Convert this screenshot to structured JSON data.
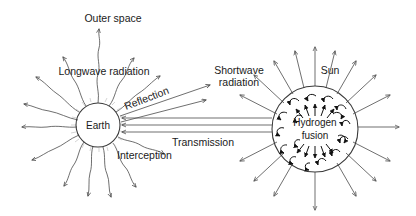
{
  "diagram": {
    "background_color": "#ffffff",
    "line_color": "#4a4a4a",
    "text_color": "#1a1a1a",
    "width": 416,
    "height": 216,
    "labels": {
      "outer_space": "Outer space",
      "longwave_radiation": "Longwave radiation",
      "reflection": "Reflection",
      "interception": "Interception",
      "transmission": "Transmission",
      "shortwave_line1": "Shortwave",
      "shortwave_line2": "radiation",
      "sun": "Sun",
      "earth": "Earth",
      "hydrogen_line1": "Hydrogen",
      "hydrogen_line2": "fusion"
    },
    "bodies": [
      {
        "name": "earth",
        "label": "Earth",
        "cx": 98,
        "cy": 125,
        "r": 22,
        "emission": "wavy-longwave-rays"
      },
      {
        "name": "sun",
        "label": "Sun",
        "interior_label": "Hydrogen fusion",
        "cx": 315,
        "cy": 129,
        "r": 43,
        "emission": "straight-shortwave-rays"
      }
    ],
    "flows": [
      {
        "name": "transmission",
        "from": "sun",
        "to": "earth",
        "line_count": 3,
        "label": "Transmission"
      },
      {
        "name": "reflection",
        "from": "earth",
        "direction": "up-right",
        "arrow_count": 2,
        "label": "Reflection"
      },
      {
        "name": "interception",
        "at": "earth",
        "label": "Interception"
      },
      {
        "name": "longwave-emission",
        "from": "earth",
        "label": "Longwave radiation"
      },
      {
        "name": "shortwave-emission",
        "from": "sun",
        "label": "Shortwave radiation"
      }
    ]
  }
}
